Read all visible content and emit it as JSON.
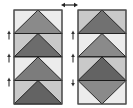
{
  "diagram": {
    "swap_arrow": {
      "glyph": "⟷",
      "x1": 61,
      "x2": 78,
      "y": 5,
      "color": "#222222"
    },
    "colors": {
      "outline": "#1a1a1a",
      "light": "#ececec",
      "medium_light": "#c9c9c9",
      "mid": "#8a8a8a",
      "dark": "#6c6c6c",
      "darker": "#606060",
      "arrow": "#333333"
    },
    "panels": [
      {
        "name": "left-column",
        "x": 14,
        "y": 10,
        "w": 48,
        "h": 94,
        "arrow_x": 9,
        "arrows": [
          {
            "y": 35,
            "dir": "up"
          },
          {
            "y": 58,
            "dir": "up"
          },
          {
            "y": 82,
            "dir": "up"
          }
        ],
        "rows": [
          {
            "orientation": "up",
            "side": "#ececec",
            "goose": "#8a8a8a"
          },
          {
            "orientation": "up",
            "side": "#c9c9c9",
            "goose": "#6c6c6c"
          },
          {
            "orientation": "up",
            "side": "#ececec",
            "goose": "#7c7c7c"
          },
          {
            "orientation": "up",
            "side": "#c9c9c9",
            "goose": "#636363"
          }
        ]
      },
      {
        "name": "right-column",
        "x": 78,
        "y": 10,
        "w": 48,
        "h": 94,
        "arrow_x": 73,
        "arrows": [
          {
            "y": 35,
            "dir": "up"
          },
          {
            "y": 58,
            "dir": "up"
          },
          {
            "y": 82,
            "dir": "down"
          }
        ],
        "rows": [
          {
            "orientation": "up",
            "side": "#c9c9c9",
            "goose": "#717171"
          },
          {
            "orientation": "up",
            "side": "#ececec",
            "goose": "#8a8a8a"
          },
          {
            "orientation": "up",
            "side": "#c9c9c9",
            "goose": "#636363"
          },
          {
            "orientation": "down",
            "side": "#ececec",
            "goose": "#8a8a8a"
          }
        ]
      }
    ]
  }
}
